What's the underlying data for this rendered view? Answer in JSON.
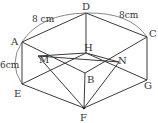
{
  "figure": {
    "vertices": {
      "D": {
        "label": "D",
        "x": 86,
        "y": 13
      },
      "A": {
        "label": "A",
        "x": 22,
        "y": 42
      },
      "C": {
        "label": "C",
        "x": 147,
        "y": 37
      },
      "H": {
        "label": "H",
        "x": 86,
        "y": 53
      },
      "M": {
        "label": "M",
        "x": 38,
        "y": 56
      },
      "N": {
        "label": "N",
        "x": 119,
        "y": 62
      },
      "B": {
        "label": "B",
        "x": 85,
        "y": 73
      },
      "E": {
        "label": "E",
        "x": 22,
        "y": 84
      },
      "G": {
        "label": "G",
        "x": 147,
        "y": 80
      },
      "F": {
        "label": "F",
        "x": 84,
        "y": 108
      }
    },
    "dimensions": {
      "AD": "8 cm",
      "DC": "8cm",
      "AE": "6cm"
    }
  }
}
